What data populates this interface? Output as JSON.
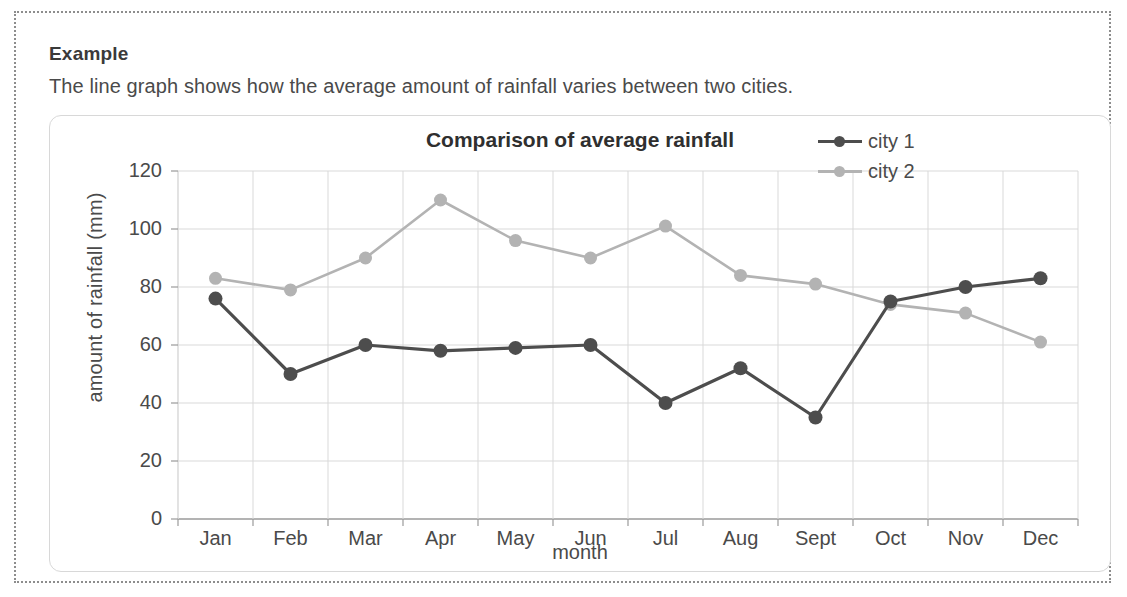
{
  "example": {
    "heading": "Example",
    "description": "The line graph shows how the average amount of rainfall varies between two cities."
  },
  "chart_data": {
    "type": "line",
    "title": "Comparison of average rainfall",
    "xlabel": "month",
    "ylabel": "amount of rainfall (mm)",
    "categories": [
      "Jan",
      "Feb",
      "Mar",
      "Apr",
      "May",
      "Jun",
      "Jul",
      "Aug",
      "Sept",
      "Oct",
      "Nov",
      "Dec"
    ],
    "series": [
      {
        "name": "city 1",
        "color": "#4d4d4d",
        "values": [
          76,
          50,
          60,
          58,
          59,
          60,
          40,
          52,
          35,
          75,
          80,
          83
        ]
      },
      {
        "name": "city 2",
        "color": "#b3b3b3",
        "values": [
          83,
          79,
          90,
          110,
          96,
          90,
          101,
          84,
          81,
          74,
          71,
          61
        ]
      }
    ],
    "ylim": [
      0,
      120
    ],
    "yticks": [
      0,
      20,
      40,
      60,
      80,
      100,
      120
    ],
    "ytick_labels": [
      "0",
      "20",
      "40",
      "60",
      "80",
      "100",
      "120"
    ],
    "grid": true,
    "legend_position": "top-right",
    "gridline_color": "#d9d9d9",
    "axis_color": "#9a9a9a"
  }
}
